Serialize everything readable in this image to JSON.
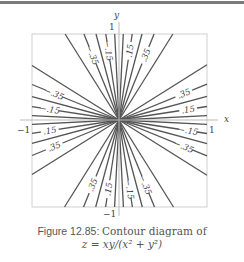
{
  "figure": {
    "caption_label": "Figure 12.85:",
    "caption_text": "Contour diagram of",
    "caption_formula": "z = xy/(x² + y²)",
    "axis_x_label": "x",
    "axis_y_label": "y",
    "tick_x_neg": "−1",
    "tick_x_pos": "1",
    "tick_y_neg": "−1",
    "tick_y_pos": "1",
    "line_color": "#555555",
    "frame_color": "#c8c8c8"
  },
  "chart_data": {
    "type": "contour",
    "function": "z = xy/(x^2 + y^2)",
    "xlim": [
      -1,
      1
    ],
    "ylim": [
      -1,
      1
    ],
    "contour_levels": [
      -0.45,
      -0.35,
      -0.25,
      -0.15,
      -0.05,
      0.05,
      0.15,
      0.25,
      0.35,
      0.45
    ],
    "labeled_levels": [
      {
        "label": ".15",
        "quadrant": "I",
        "near": "top"
      },
      {
        "label": ".35",
        "quadrant": "I",
        "near": "top"
      },
      {
        "label": ".35",
        "quadrant": "I",
        "near": "right"
      },
      {
        "label": ".15",
        "quadrant": "I",
        "near": "right"
      },
      {
        "label": "−.15",
        "quadrant": "II",
        "near": "top"
      },
      {
        "label": "−.35",
        "quadrant": "II",
        "near": "top"
      },
      {
        "label": "−.35",
        "quadrant": "II",
        "near": "left"
      },
      {
        "label": "−.15",
        "quadrant": "II",
        "near": "left"
      },
      {
        "label": ".35",
        "quadrant": "III",
        "near": "left"
      },
      {
        "label": ".15",
        "quadrant": "III",
        "near": "left"
      },
      {
        "label": ".15",
        "quadrant": "III",
        "near": "bottom"
      },
      {
        "label": ".35",
        "quadrant": "III",
        "near": "bottom"
      },
      {
        "label": "−.15",
        "quadrant": "IV",
        "near": "right"
      },
      {
        "label": "−.35",
        "quadrant": "IV",
        "near": "right"
      },
      {
        "label": "−.35",
        "quadrant": "IV",
        "near": "bottom"
      },
      {
        "label": "−.15",
        "quadrant": "IV",
        "near": "bottom"
      }
    ],
    "grid": false
  }
}
